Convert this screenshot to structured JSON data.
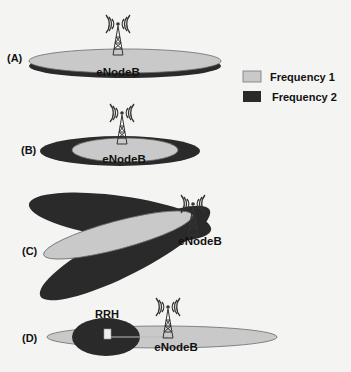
{
  "colors": {
    "frequency1": "#c9c9c9",
    "frequency2": "#2a2a2a",
    "outline": "#6a6a6a",
    "background": "#f4f4f2",
    "text": "#111111"
  },
  "legend": {
    "items": [
      {
        "label": "Frequency 1",
        "swatch": "frequency1"
      },
      {
        "label": "Frequency 2",
        "swatch": "frequency2"
      }
    ]
  },
  "scenarios": [
    {
      "id": "A",
      "label": "(A)",
      "station_label": "eNodeB"
    },
    {
      "id": "B",
      "label": "(B)",
      "station_label": "eNodeB"
    },
    {
      "id": "C",
      "label": "(C)",
      "station_label": "eNodeB"
    },
    {
      "id": "D",
      "label": "(D)",
      "station_label": "eNodeB",
      "rrh_label": "RRH"
    }
  ],
  "icons": {
    "tower": "antenna-tower-icon"
  }
}
